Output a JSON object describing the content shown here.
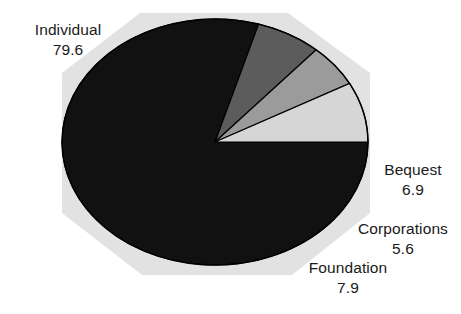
{
  "chart_data": {
    "type": "pie",
    "title": "",
    "subtitle": "",
    "xlabel": "",
    "ylabel": "",
    "legend_position": "none",
    "grid": false,
    "units": "percent",
    "categories": [
      "Individual",
      "Bequest",
      "Corporations",
      "Foundation"
    ],
    "values": [
      79.6,
      6.9,
      5.6,
      7.9
    ],
    "slices": [
      {
        "label": "Individual",
        "value": "79.6",
        "numeric": 79.6,
        "color": "#111111",
        "label_position": "top-left"
      },
      {
        "label": "Bequest",
        "value": "6.9",
        "numeric": 6.9,
        "color": "#5c5c5c",
        "label_position": "right"
      },
      {
        "label": "Corporations",
        "value": "5.6",
        "numeric": 5.6,
        "color": "#9b9b9b",
        "label_position": "lower-right"
      },
      {
        "label": "Foundation",
        "value": "7.9",
        "numeric": 7.9,
        "color": "#d6d6d6",
        "label_position": "bottom"
      }
    ]
  },
  "figure": {
    "background_color": "#ffffff",
    "plate_color": "#e2e2e2",
    "outline_color": "#000000",
    "text_color": "#1a1a1a",
    "start_angle_deg": 0,
    "direction": "clockwise",
    "ellipse": {
      "cx": 215,
      "cy": 142,
      "rx": 153,
      "ry": 123
    }
  },
  "labels": {
    "individual": {
      "name": "Individual",
      "value": "79.6"
    },
    "bequest": {
      "name": "Bequest",
      "value": "6.9"
    },
    "corporations": {
      "name": "Corporations",
      "value": "5.6"
    },
    "foundation": {
      "name": "Foundation",
      "value": "7.9"
    }
  }
}
